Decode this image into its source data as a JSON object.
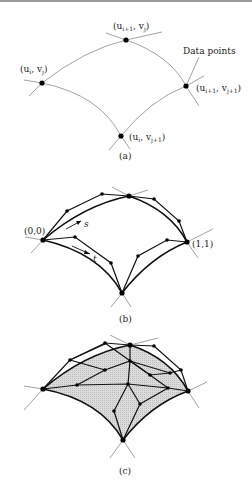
{
  "figure": {
    "panels": [
      {
        "id": "a",
        "caption": "(a)",
        "annotation": "Data points",
        "points": [
          {
            "name": "u_i_v_j",
            "label_base": "(u",
            "label_sub1": "i",
            "label_mid": ", v",
            "label_sub2": "j",
            "label_end": ")"
          },
          {
            "name": "u_i1_v_j",
            "label_base": "(u",
            "label_sub1": "i+1",
            "label_mid": ", v",
            "label_sub2": "j",
            "label_end": ")"
          },
          {
            "name": "u_i1_v_j1",
            "label_base": "(u",
            "label_sub1": "i+1",
            "label_mid": ", v",
            "label_sub2": "j+1",
            "label_end": ")"
          },
          {
            "name": "u_i_v_j1",
            "label_base": "(u",
            "label_sub1": "i",
            "label_mid": ", v",
            "label_sub2": "j+1",
            "label_end": ")"
          }
        ]
      },
      {
        "id": "b",
        "caption": "(b)",
        "corner_labels": {
          "origin": "(0,0)",
          "far": "(1,1)"
        },
        "param_labels": {
          "s": "s",
          "t": "t"
        }
      },
      {
        "id": "c",
        "caption": "(c)"
      }
    ],
    "colors": {
      "curve_thin": "#8a8a8a",
      "curve_thick": "#111111",
      "surface_fill": "#d6d6d6",
      "dot": "#000000"
    }
  }
}
